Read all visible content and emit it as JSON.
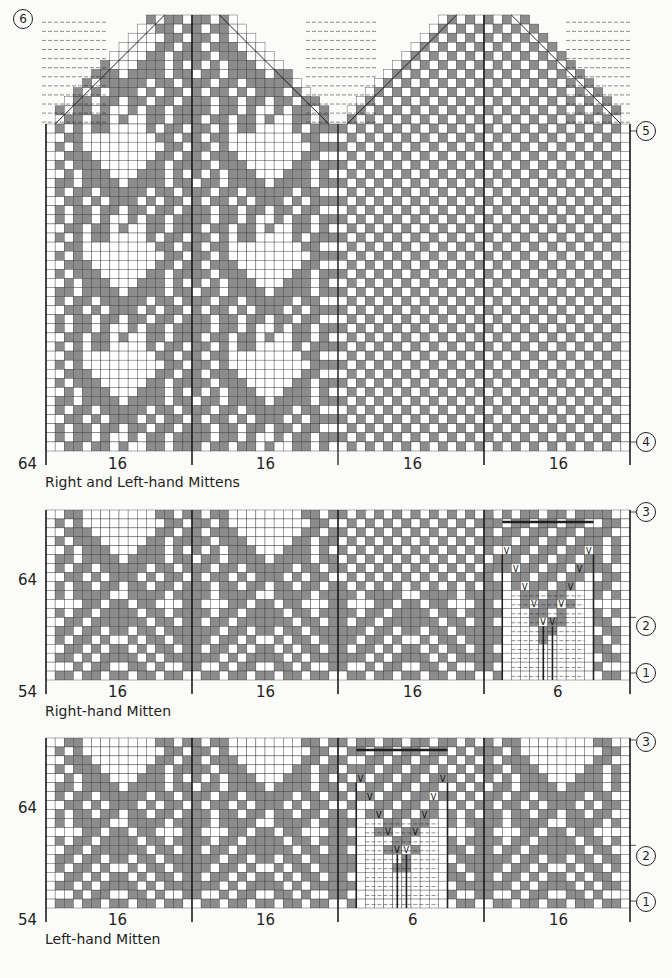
{
  "colors": {
    "contrast": "#8c8c8c",
    "main": "#ffffff",
    "grid": "#231f20",
    "background": "#fbfbfa"
  },
  "charts": [
    {
      "id": "both",
      "caption": "Right and Left-hand Mittens",
      "row_label": "64",
      "section_labels": [
        "16",
        "16",
        "16",
        "16"
      ],
      "markers": [
        {
          "text": "6",
          "side": "left",
          "y": 27
        },
        {
          "text": "5",
          "side": "right",
          "y": 131
        },
        {
          "text": "4",
          "side": "right",
          "y": 442
        }
      ]
    },
    {
      "id": "right",
      "caption": "Right-hand Mitten",
      "row_label_top": "64",
      "row_label_bottom": "54",
      "section_labels": [
        "16",
        "16",
        "16",
        "6"
      ],
      "markers": [
        {
          "text": "3",
          "side": "right",
          "y": 512
        },
        {
          "text": "2",
          "side": "right",
          "y": 626
        },
        {
          "text": "1",
          "side": "right",
          "y": 673
        }
      ]
    },
    {
      "id": "left",
      "caption": "Left-hand Mitten",
      "row_label_top": "64",
      "row_label_bottom": "54",
      "section_labels": [
        "16",
        "16",
        "6",
        "16"
      ],
      "markers": [
        {
          "text": "3",
          "side": "right",
          "y": 742
        },
        {
          "text": "2",
          "side": "right",
          "y": 856
        },
        {
          "text": "1",
          "side": "right",
          "y": 902
        }
      ]
    }
  ],
  "legend": {
    "increase_symbol": "V"
  }
}
